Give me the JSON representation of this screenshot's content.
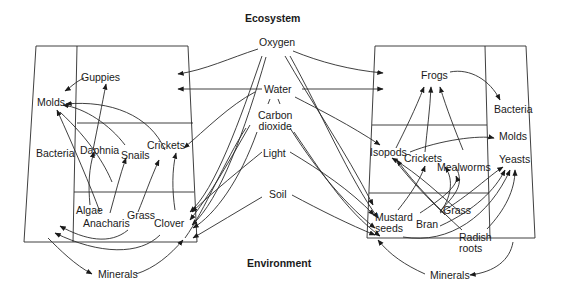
{
  "header": {
    "title": "Ecosystem"
  },
  "footer": {
    "title": "Environment"
  },
  "environment_factors": [
    {
      "label": "Oxygen"
    },
    {
      "label": "Water"
    },
    {
      "label": "Carbon\ndioxide",
      "line1": "Carbon",
      "line2": "dioxide"
    },
    {
      "label": "Light"
    },
    {
      "label": "Soil"
    }
  ],
  "aquarium": {
    "decomposers": [
      "Molds",
      "Bacteria"
    ],
    "consumers": [
      "Guppies",
      "Daphnia",
      "Snails",
      "Crickets"
    ],
    "producers": [
      "Algae",
      "Anacharis",
      "Grass",
      "Clover"
    ],
    "minerals": "Minerals"
  },
  "terrarium": {
    "decomposers": [
      "Bacteria",
      "Molds",
      "Yeasts"
    ],
    "consumers": [
      "Frogs",
      "Isopods",
      "Crickets",
      "Mealworms"
    ],
    "producers": [
      "Mustard seeds",
      "Grass",
      "Bran",
      "Radish roots"
    ],
    "producer_lines": {
      "mustard1": "Mustard",
      "mustard2": "seeds",
      "radish1": "Radish",
      "radish2": "roots"
    },
    "minerals": "Minerals"
  },
  "colors": {
    "line": "#2a2a2a",
    "background": "#ffffff",
    "text": "#1a1a1a"
  }
}
